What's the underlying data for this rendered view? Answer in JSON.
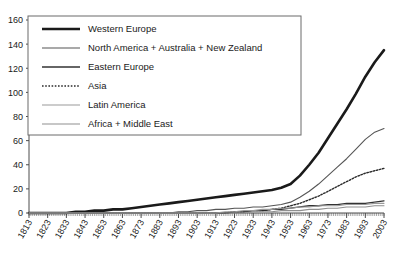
{
  "chart_data": {
    "type": "line",
    "title": "",
    "subtitle": "",
    "xlabel": "",
    "ylabel": "",
    "xlim": [
      1813,
      2003
    ],
    "ylim": [
      0,
      160
    ],
    "grid": false,
    "legend_position": "top-left",
    "yticks": [
      0,
      20,
      40,
      60,
      80,
      100,
      120,
      140,
      160
    ],
    "xticks": [
      1813,
      1823,
      1833,
      1843,
      1853,
      1863,
      1873,
      1883,
      1893,
      1903,
      1913,
      1923,
      1933,
      1943,
      1953,
      1963,
      1973,
      1983,
      1993,
      2003
    ],
    "x": [
      1813,
      1818,
      1823,
      1828,
      1833,
      1838,
      1843,
      1848,
      1853,
      1858,
      1863,
      1868,
      1873,
      1878,
      1883,
      1888,
      1893,
      1898,
      1903,
      1908,
      1913,
      1918,
      1923,
      1928,
      1933,
      1938,
      1943,
      1948,
      1953,
      1958,
      1963,
      1968,
      1973,
      1978,
      1983,
      1988,
      1993,
      1998,
      2003
    ],
    "series": [
      {
        "name": "Western Europe",
        "color": "#1a1a1a",
        "style": "solid",
        "width": 2.6,
        "values": [
          0,
          0,
          0,
          0,
          0,
          1,
          1,
          2,
          2,
          3,
          3,
          4,
          5,
          6,
          7,
          8,
          9,
          10,
          11,
          12,
          13,
          14,
          15,
          16,
          17,
          18,
          19,
          21,
          24,
          31,
          40,
          50,
          62,
          74,
          86,
          99,
          113,
          125,
          135
        ]
      },
      {
        "name": "North America + Australia + New Zealand",
        "color": "#555555",
        "style": "solid",
        "width": 1.1,
        "values": [
          0,
          0,
          0,
          0,
          0,
          0,
          0,
          0,
          0,
          0,
          0,
          0,
          0,
          0,
          0,
          0,
          1,
          1,
          2,
          2,
          3,
          3,
          4,
          4,
          5,
          5,
          6,
          7,
          9,
          13,
          18,
          24,
          31,
          38,
          45,
          53,
          61,
          67,
          70
        ]
      },
      {
        "name": "Eastern Europe",
        "color": "#333333",
        "style": "solid",
        "width": 1.3,
        "values": [
          0,
          0,
          0,
          0,
          0,
          0,
          0,
          0,
          0,
          0,
          0,
          0,
          0,
          0,
          0,
          0,
          0,
          0,
          0,
          0,
          0,
          0,
          1,
          1,
          2,
          2,
          3,
          3,
          4,
          5,
          6,
          6,
          7,
          7,
          8,
          8,
          8,
          9,
          10
        ]
      },
      {
        "name": "Asia",
        "color": "#2b2b2b",
        "style": "dotted",
        "width": 1.4,
        "values": [
          0,
          0,
          0,
          0,
          0,
          0,
          0,
          0,
          0,
          0,
          0,
          0,
          0,
          0,
          0,
          0,
          0,
          0,
          0,
          0,
          0,
          0,
          1,
          1,
          2,
          2,
          3,
          4,
          6,
          8,
          11,
          14,
          18,
          22,
          26,
          30,
          33,
          35,
          37
        ]
      },
      {
        "name": "Latin America",
        "color": "#9a9a9a",
        "style": "solid",
        "width": 1.1,
        "values": [
          0,
          0,
          0,
          0,
          0,
          0,
          0,
          0,
          0,
          0,
          0,
          0,
          0,
          0,
          0,
          0,
          0,
          0,
          0,
          0,
          0,
          1,
          1,
          2,
          2,
          3,
          3,
          4,
          4,
          5,
          5,
          6,
          6,
          6,
          7,
          7,
          7,
          8,
          8
        ]
      },
      {
        "name": "Africa + Middle East",
        "color": "#8f8f8f",
        "style": "solid",
        "width": 1.1,
        "values": [
          0,
          0,
          0,
          0,
          0,
          0,
          0,
          0,
          0,
          0,
          0,
          0,
          0,
          0,
          0,
          0,
          0,
          0,
          0,
          0,
          0,
          0,
          0,
          0,
          1,
          1,
          1,
          2,
          2,
          2,
          3,
          3,
          4,
          4,
          5,
          5,
          5,
          6,
          6
        ]
      }
    ]
  },
  "legend": {
    "items": [
      {
        "label": "Western Europe",
        "swatch": "thick-black-line-swatch"
      },
      {
        "label": "North America + Australia + New Zealand",
        "swatch": "medium-black-line-swatch"
      },
      {
        "label": "Eastern Europe",
        "swatch": "medium-black-line-swatch"
      },
      {
        "label": "Asia",
        "swatch": "dotted-line-swatch"
      },
      {
        "label": "Latin America",
        "swatch": "thin-gray-line-swatch"
      },
      {
        "label": "Africa + Middle East",
        "swatch": "thin-gray-line-swatch"
      }
    ]
  },
  "axes": {
    "y_labels": [
      "160",
      "140",
      "120",
      "100",
      "80",
      "60",
      "40",
      "20",
      "0"
    ],
    "x_labels": [
      "1813",
      "1823",
      "1833",
      "1843",
      "1853",
      "1863",
      "1873",
      "1883",
      "1893",
      "1903",
      "1913",
      "1923",
      "1933",
      "1943",
      "1953",
      "1963",
      "1973",
      "1983",
      "1993",
      "2003"
    ]
  },
  "colors": {
    "axis": "#4d4d4d",
    "text": "#1a1a1a",
    "plot_background": "#ffffff"
  }
}
